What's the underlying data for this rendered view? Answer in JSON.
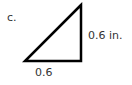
{
  "problem": {
    "part_label": "c.",
    "shape": "right-triangle",
    "sides": {
      "vertical": "0.6 in.",
      "horizontal": "0.6"
    },
    "vertices": {
      "top": [
        81,
        5
      ],
      "bottom_left": [
        25,
        61
      ],
      "bottom_right": [
        81,
        61
      ]
    },
    "stroke_color": "#000000",
    "text_color": "#333333"
  }
}
